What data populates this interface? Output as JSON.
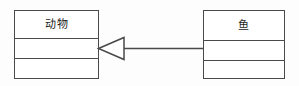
{
  "diagram": {
    "type": "uml-class-diagram",
    "width": 299,
    "height": 86,
    "background_color": "#fdfdfd",
    "line_color": "#4a4a4a",
    "fill_color": "#ffffff",
    "text_color": "#1d1d1d"
  },
  "classes": [
    {
      "id": "animal",
      "name": "动物",
      "attributes": "",
      "operations": "",
      "x": 14,
      "y": 10,
      "width": 85,
      "height": 69
    },
    {
      "id": "fish",
      "name": "鱼",
      "attributes": "",
      "operations": "",
      "x": 203,
      "y": 10,
      "width": 82,
      "height": 69
    }
  ],
  "relationships": [
    {
      "id": "generalization-fish-animal",
      "type": "generalization",
      "label": "",
      "source": "鱼",
      "target": "动物",
      "arrow_style": "hollow-triangle",
      "line_style": "solid"
    }
  ]
}
